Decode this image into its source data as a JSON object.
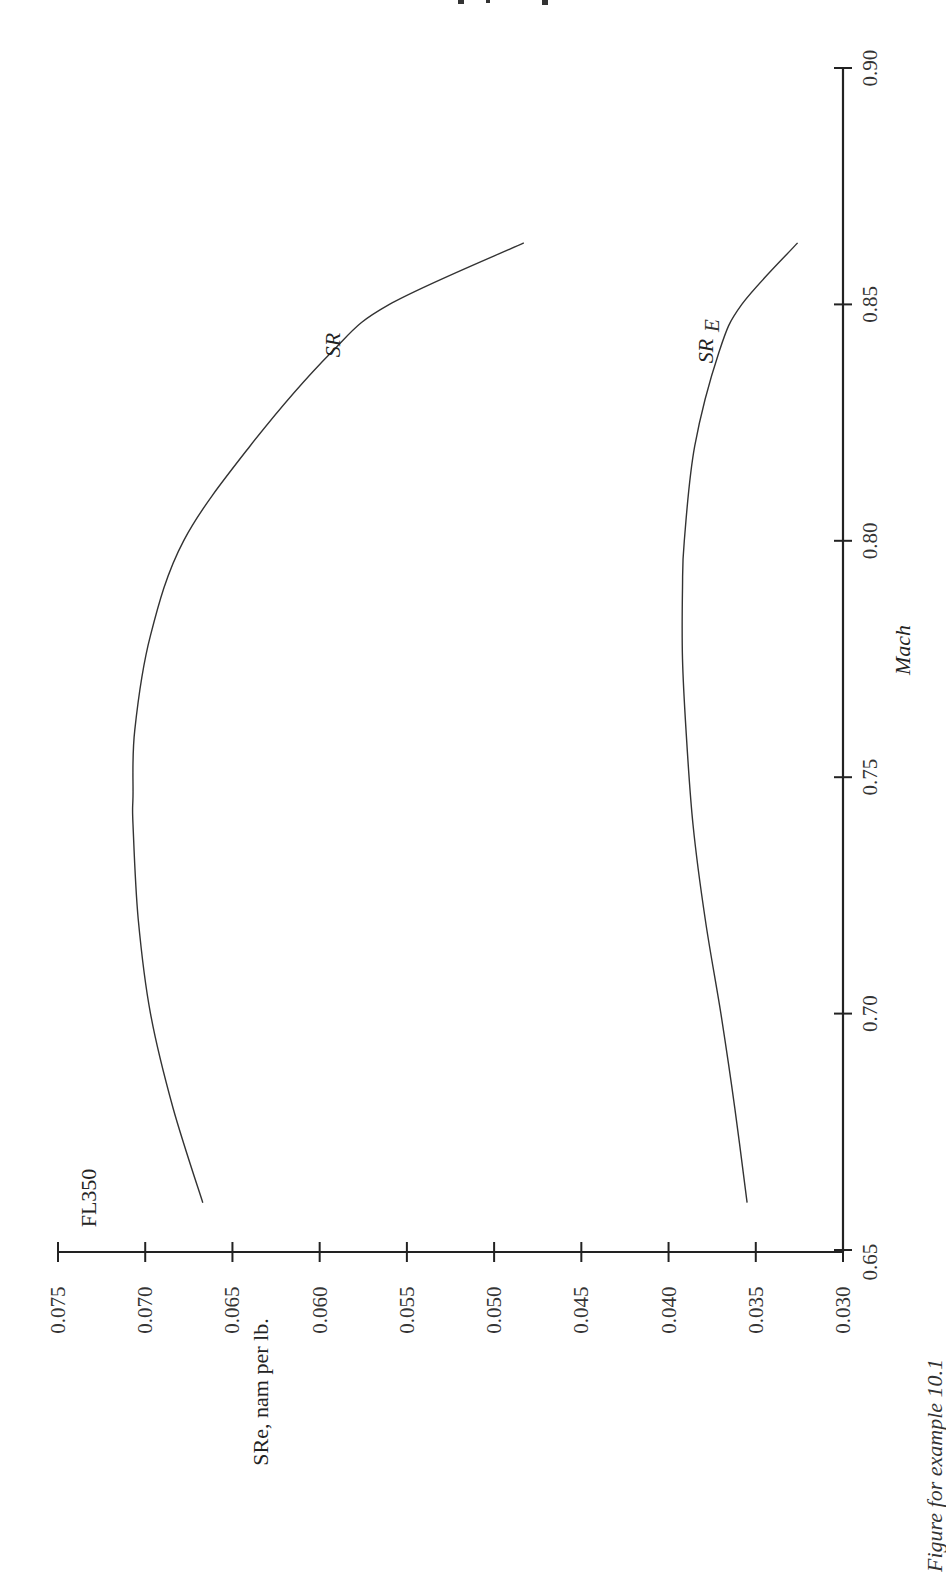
{
  "page": {
    "header_fragment": "…",
    "caption": "Figure for example 10.1",
    "orientation": "rotated 90° counter-clockwise"
  },
  "chart_data": {
    "type": "line",
    "title": "",
    "annotation": "FL350",
    "xlabel": "Mach",
    "ylabel": "SRe, nam per lb.",
    "xlim": [
      0.65,
      0.9
    ],
    "ylim": [
      0.03,
      0.075
    ],
    "x_ticks": [
      "0.65",
      "0.70",
      "0.75",
      "0.80",
      "0.85",
      "0.90"
    ],
    "y_ticks": [
      "0.075",
      "0.070",
      "0.065",
      "0.060",
      "0.055",
      "0.050",
      "0.045",
      "0.040",
      "0.035",
      "0.030"
    ],
    "grid": false,
    "legend": "inline curve labels",
    "series": [
      {
        "name": "SR",
        "label": "SR",
        "x": [
          0.66,
          0.68,
          0.7,
          0.72,
          0.74,
          0.746,
          0.76,
          0.78,
          0.8,
          0.82,
          0.84,
          0.85,
          0.863
        ],
        "values": [
          0.0667,
          0.0684,
          0.0697,
          0.0704,
          0.0707,
          0.0707,
          0.0706,
          0.0697,
          0.0678,
          0.064,
          0.0593,
          0.056,
          0.0483
        ]
      },
      {
        "name": "SR_E",
        "label": "SR",
        "label_subscript": "E",
        "x": [
          0.66,
          0.68,
          0.7,
          0.72,
          0.74,
          0.76,
          0.775,
          0.79,
          0.8,
          0.82,
          0.84,
          0.85,
          0.863
        ],
        "values": [
          0.0355,
          0.0362,
          0.037,
          0.0379,
          0.0386,
          0.039,
          0.0392,
          0.0392,
          0.0391,
          0.0385,
          0.0371,
          0.0358,
          0.0326
        ]
      }
    ]
  }
}
